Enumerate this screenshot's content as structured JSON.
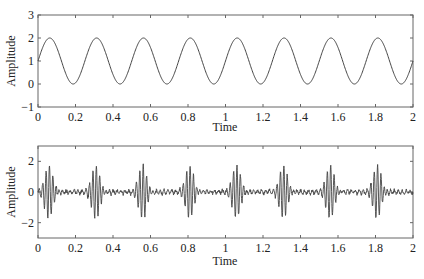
{
  "chart_data": [
    {
      "type": "line",
      "title": "",
      "xlabel": "Time",
      "ylabel": "Amplitude",
      "xlim": [
        0,
        2
      ],
      "ylim": [
        -1,
        3
      ],
      "xticks": [
        "0",
        "0.2",
        "0.4",
        "0.6",
        "0.8",
        "1",
        "1.2",
        "1.4",
        "1.6",
        "1.8",
        "2"
      ],
      "yticks": [
        "-1",
        "0",
        "1",
        "2",
        "3"
      ],
      "grid": false,
      "legend": null,
      "series": [
        {
          "name": "signal",
          "description": "1 + sin(2*pi*4*t), sinusoid with period 0.25, peaks at 2, troughs at 0",
          "offset": 1,
          "amplitude": 1,
          "frequency": 4,
          "x": [
            0,
            0.0625,
            0.125,
            0.1875,
            0.25,
            0.3125,
            0.375,
            0.4375,
            0.5,
            0.5625,
            0.625,
            0.6875,
            0.75,
            0.8125,
            0.875,
            0.9375,
            1.0,
            1.0625,
            1.125,
            1.1875,
            1.25,
            1.3125,
            1.375,
            1.4375,
            1.5,
            1.5625,
            1.625,
            1.6875,
            1.75,
            1.8125,
            1.875,
            1.9375,
            2.0
          ],
          "values": [
            1,
            2,
            1,
            0,
            1,
            2,
            1,
            0,
            1,
            2,
            1,
            0,
            1,
            2,
            1,
            0,
            1,
            2,
            1,
            0,
            1,
            2,
            1,
            0,
            1,
            2,
            1,
            0,
            1,
            2,
            1,
            0,
            1
          ]
        }
      ]
    },
    {
      "type": "line",
      "title": "",
      "xlabel": "Time",
      "ylabel": "Amplitude",
      "xlim": [
        0,
        2
      ],
      "ylim": [
        -3,
        3
      ],
      "xticks": [
        "0",
        "0.2",
        "0.4",
        "0.6",
        "0.8",
        "1",
        "1.2",
        "1.4",
        "1.6",
        "1.8",
        "2"
      ],
      "yticks": [
        "-2",
        "0",
        "2"
      ],
      "grid": false,
      "legend": null,
      "series": [
        {
          "name": "burst signal",
          "description": "Periodic oscillatory bursts (period 0.25, centered near t=0.06+0.25k) reaching about +/-1.8, with low-level noise (~+/-0.3) between bursts",
          "burst_centers": [
            0.06,
            0.31,
            0.56,
            0.81,
            1.06,
            1.31,
            1.56,
            1.81
          ],
          "burst_peak_amplitude": 1.8,
          "noise_amplitude": 0.3
        }
      ]
    }
  ],
  "plots": {
    "top": {
      "ylabel": "Amplitude",
      "xlabel": "Time",
      "xticks": [
        "0",
        "0.2",
        "0.4",
        "0.6",
        "0.8",
        "1",
        "1.2",
        "1.4",
        "1.6",
        "1.8",
        "2"
      ],
      "yticks": [
        "-1",
        "0",
        "1",
        "2",
        "3"
      ]
    },
    "bottom": {
      "ylabel": "Amplitude",
      "xlabel": "Time",
      "xticks": [
        "0",
        "0.2",
        "0.4",
        "0.6",
        "0.8",
        "1",
        "1.2",
        "1.4",
        "1.6",
        "1.8",
        "2"
      ],
      "yticks": [
        "-2",
        "0",
        "2"
      ]
    }
  },
  "colors": {
    "line": "#444444",
    "axis": "#555555"
  }
}
